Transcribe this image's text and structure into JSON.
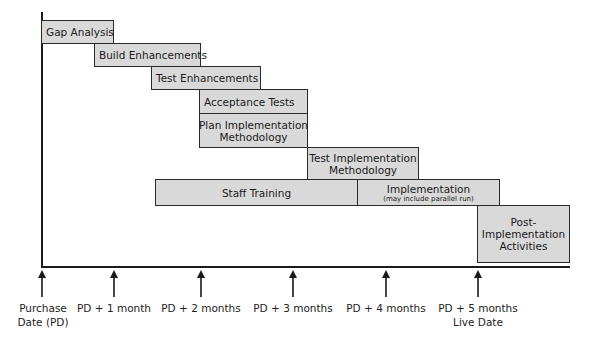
{
  "tasks": [
    {
      "label": "Gap Analysis"
    },
    {
      "label": "Build Enhancements"
    },
    {
      "label": "Test Enhancements"
    },
    {
      "label": "Acceptance Tests"
    },
    {
      "label_line1": "Plan Implementation",
      "label_line2": "Methodology"
    },
    {
      "label_line1": "Test Implementation",
      "label_line2": "Methodology"
    },
    {
      "label": "Staff Training"
    },
    {
      "label": "Implementation",
      "note": "(may include parallel run)"
    },
    {
      "label_line1": "Post-",
      "label_line2": "Implementation",
      "label_line3": "Activities"
    }
  ],
  "milestones": [
    {
      "line1": "Purchase",
      "line2": "Date (PD)"
    },
    {
      "line1": "PD + 1 month"
    },
    {
      "line1": "PD + 2 months"
    },
    {
      "line1": "PD + 3 months"
    },
    {
      "line1": "PD + 4 months"
    },
    {
      "line1": "PD + 5 months",
      "line2": "Live Date"
    }
  ]
}
